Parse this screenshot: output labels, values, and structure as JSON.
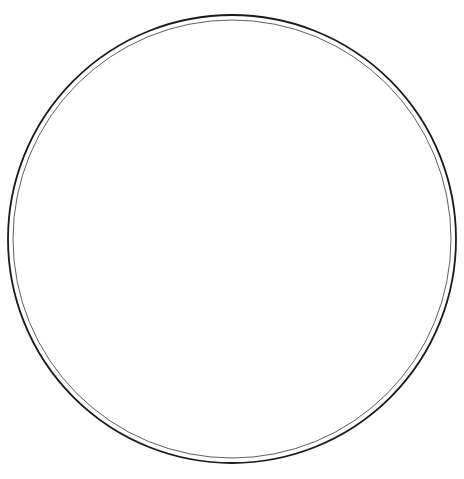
{
  "figure": {
    "type": "polar-isogonic-declination-map",
    "ink_color": "#1a1a1a",
    "paper_color": "#ffffff"
  },
  "labels": [
    {
      "id": "declination-zero-west",
      "text": "DECLINATION ZERO",
      "x": 172,
      "y": 212,
      "rot": -8,
      "size": 6.2,
      "spacing": 0.8
    },
    {
      "id": "declination-zero-east",
      "text": "DECLINATION ZERO",
      "x": 329,
      "y": 215,
      "rot": -9,
      "size": 6.2,
      "spacing": 0.8
    },
    {
      "id": "declination-zero-south",
      "text": "DECLINATION ZERO",
      "x": 221,
      "y": 421,
      "rot": -84,
      "size": 6.0,
      "spacing": 0.6
    },
    {
      "id": "magnetic-pole",
      "text": "MAGNETIC POLE",
      "x": 207,
      "y": 333,
      "rot": -40,
      "size": 5.0,
      "spacing": 0.3
    },
    {
      "id": "isogonic-10e-west",
      "text": "10°E",
      "x": 157,
      "y": 236,
      "rot": -38,
      "size": 4.8,
      "spacing": 0
    },
    {
      "id": "isogonic-20e-west",
      "text": "20°E",
      "x": 166,
      "y": 251,
      "rot": -44,
      "size": 4.8,
      "spacing": 0
    },
    {
      "id": "isogonic-30e-west",
      "text": "30°E",
      "x": 172,
      "y": 261,
      "rot": -50,
      "size": 4.8,
      "spacing": 0
    },
    {
      "id": "isogonic-40e-west",
      "text": "40°E",
      "x": 178,
      "y": 272,
      "rot": -54,
      "size": 4.8,
      "spacing": 0
    },
    {
      "id": "isogonic-50e-west",
      "text": "50°E",
      "x": 184,
      "y": 282,
      "rot": -58,
      "size": 4.8,
      "spacing": 0
    },
    {
      "id": "isogonic-60e-west",
      "text": "60°E",
      "x": 190,
      "y": 291,
      "rot": -62,
      "size": 4.8,
      "spacing": 0
    },
    {
      "id": "isogonic-70e-west",
      "text": "70°E",
      "x": 195,
      "y": 299,
      "rot": -66,
      "size": 4.8,
      "spacing": 0
    },
    {
      "id": "isogonic-80e-west",
      "text": "80°E",
      "x": 200,
      "y": 306,
      "rot": -70,
      "size": 4.8,
      "spacing": 0
    },
    {
      "id": "isogonic-10w-east",
      "text": "10°W",
      "x": 310,
      "y": 233,
      "rot": 6,
      "size": 4.8,
      "spacing": 0
    },
    {
      "id": "isogonic-20w-east",
      "text": "20°W",
      "x": 311,
      "y": 247,
      "rot": 9,
      "size": 4.8,
      "spacing": 0
    },
    {
      "id": "isogonic-30w-east",
      "text": "30°W",
      "x": 289,
      "y": 261,
      "rot": 58,
      "size": 4.8,
      "spacing": 0
    },
    {
      "id": "isogonic-40w-east",
      "text": "40°W",
      "x": 288,
      "y": 276,
      "rot": 62,
      "size": 4.8,
      "spacing": 0
    },
    {
      "id": "isogonic-50w-east",
      "text": "50°W",
      "x": 287,
      "y": 291,
      "rot": 66,
      "size": 4.8,
      "spacing": 0
    },
    {
      "id": "isogonic-10e-top",
      "text": "10°E",
      "x": 214,
      "y": 91,
      "rot": 78,
      "size": 4.8,
      "spacing": 0
    },
    {
      "id": "isogonic-10e-top2",
      "text": "10°E",
      "x": 226,
      "y": 128,
      "rot": 62,
      "size": 4.8,
      "spacing": 0
    }
  ]
}
